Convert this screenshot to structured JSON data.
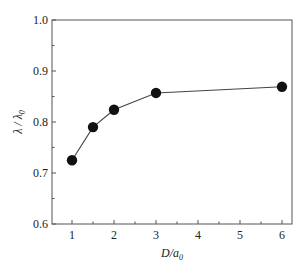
{
  "chart_data": {
    "type": "line",
    "title": "",
    "xlabel": "D/a0",
    "xlabel_main": "D/a",
    "xlabel_sub": "0",
    "ylabel": "λ/λ0",
    "ylabel_main": "λ / λ",
    "ylabel_sub": "0",
    "xlim": [
      0.5,
      6.25
    ],
    "ylim": [
      0.6,
      1.0
    ],
    "x_ticks": [
      1,
      2,
      3,
      4,
      5,
      6
    ],
    "x_tick_labels": [
      "1",
      "2",
      "3",
      "4",
      "5",
      "6"
    ],
    "y_ticks": [
      0.6,
      0.7,
      0.8,
      0.9,
      1.0
    ],
    "y_tick_labels": [
      "0.6",
      "0.7",
      "0.8",
      "0.9",
      "1.0"
    ],
    "grid": false,
    "legend": null,
    "series": [
      {
        "name": "λ/λ0",
        "marker": "filled-circle",
        "color": "#111111",
        "x": [
          1,
          1.5,
          2,
          3,
          6
        ],
        "values": [
          0.725,
          0.79,
          0.824,
          0.857,
          0.869
        ]
      }
    ]
  }
}
